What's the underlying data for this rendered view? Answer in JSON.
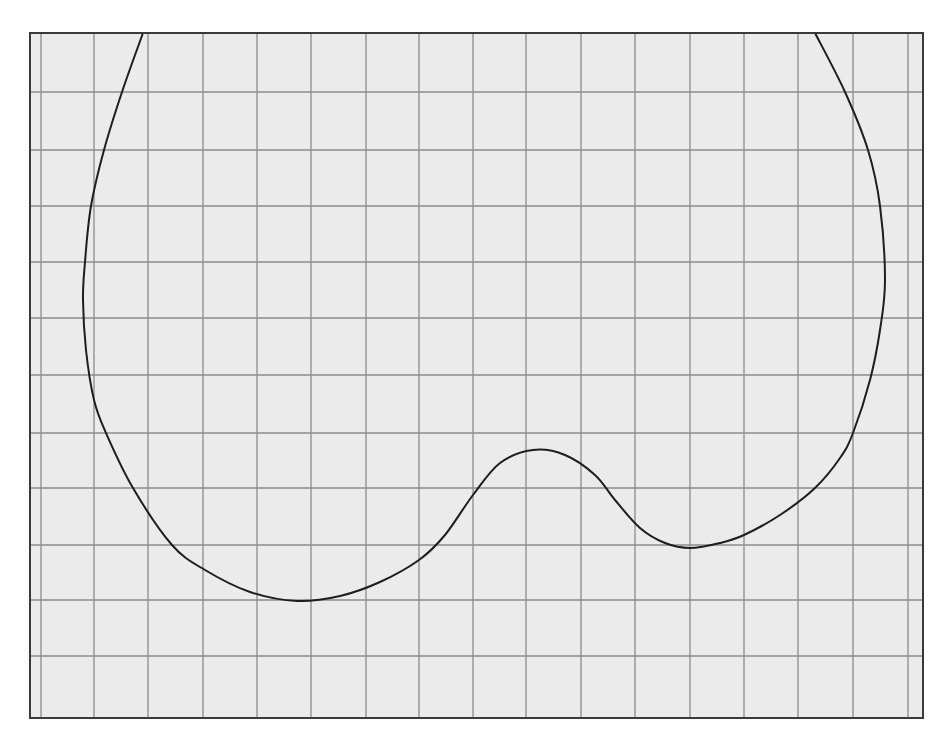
{
  "colors": {
    "page_background": "#ffffff",
    "plot_background": "#ebebeb",
    "grid_line": "#8c8c8c",
    "frame": "#3a3a3a",
    "curve": "#1e1e1e"
  },
  "frame": {
    "left": 30,
    "top": 33,
    "right": 923,
    "bottom": 718
  },
  "grid": {
    "vertical_px": [
      41,
      94,
      148,
      203,
      257,
      311,
      366,
      419,
      473,
      526,
      581,
      635,
      690,
      744,
      798,
      853,
      908
    ],
    "horizontal_px": [
      92,
      150,
      206,
      262,
      318,
      375,
      433,
      488,
      545,
      600,
      656
    ]
  },
  "curve_px": [
    [
      143,
      33
    ],
    [
      122,
      92
    ],
    [
      104,
      150
    ],
    [
      91,
      206
    ],
    [
      85,
      262
    ],
    [
      83,
      300
    ],
    [
      86,
      350
    ],
    [
      94,
      400
    ],
    [
      106,
      433
    ],
    [
      133,
      488
    ],
    [
      172,
      545
    ],
    [
      205,
      570
    ],
    [
      250,
      592
    ],
    [
      297,
      601
    ],
    [
      340,
      596
    ],
    [
      380,
      582
    ],
    [
      419,
      560
    ],
    [
      445,
      535
    ],
    [
      473,
      495
    ],
    [
      500,
      463
    ],
    [
      533,
      450
    ],
    [
      565,
      455
    ],
    [
      595,
      475
    ],
    [
      615,
      500
    ],
    [
      640,
      528
    ],
    [
      665,
      543
    ],
    [
      690,
      548
    ],
    [
      720,
      543
    ],
    [
      744,
      535
    ],
    [
      780,
      515
    ],
    [
      815,
      488
    ],
    [
      840,
      458
    ],
    [
      853,
      433
    ],
    [
      870,
      380
    ],
    [
      880,
      330
    ],
    [
      885,
      280
    ],
    [
      880,
      206
    ],
    [
      868,
      150
    ],
    [
      845,
      92
    ],
    [
      815,
      33
    ]
  ],
  "chart_data": {
    "type": "line",
    "title": "",
    "xlabel": "",
    "ylabel": "",
    "grid": true,
    "legend": null,
    "x_grid_count": 17,
    "y_grid_count": 11,
    "xlim": [
      0,
      16.5
    ],
    "ylim": [
      0,
      12.2
    ],
    "units": "grid squares from bottom-left corner of frame",
    "series": [
      {
        "name": "curve",
        "x": [
          2.1,
          1.7,
          1.4,
          1.1,
          1.0,
          1.0,
          1.0,
          1.2,
          1.4,
          1.9,
          2.6,
          3.2,
          4.1,
          5.0,
          5.7,
          6.5,
          7.2,
          7.7,
          8.2,
          8.7,
          9.3,
          9.9,
          10.5,
          10.8,
          11.3,
          11.8,
          12.2,
          12.8,
          13.2,
          13.9,
          14.5,
          15.0,
          15.2,
          15.6,
          15.7,
          15.8,
          15.7,
          15.5,
          15.1,
          14.5
        ],
        "y": [
          12.2,
          11.2,
          10.1,
          9.1,
          8.1,
          7.4,
          6.5,
          5.6,
          5.1,
          4.1,
          3.1,
          2.6,
          2.3,
          2.1,
          2.2,
          2.4,
          2.8,
          3.3,
          4.0,
          4.6,
          4.8,
          4.7,
          4.4,
          3.9,
          3.4,
          3.1,
          3.0,
          3.1,
          3.3,
          3.6,
          4.1,
          4.6,
          5.1,
          6.0,
          6.9,
          7.8,
          9.1,
          10.1,
          11.2,
          12.2
        ]
      }
    ]
  }
}
